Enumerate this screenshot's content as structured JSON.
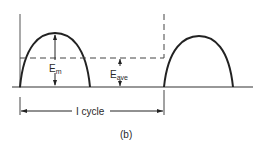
{
  "figure": {
    "caption": "(b)",
    "labels": {
      "peak": "E",
      "peak_sub": "m",
      "average": "E",
      "average_sub": "ave",
      "period": "I cycle"
    },
    "colors": {
      "stroke": "#2a2a2a",
      "background": "#ffffff"
    }
  }
}
